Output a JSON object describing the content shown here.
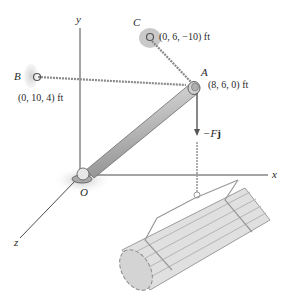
{
  "diagram": {
    "axes": {
      "x_label": "x",
      "y_label": "y",
      "z_label": "z"
    },
    "points": {
      "origin": {
        "label": "O"
      },
      "A": {
        "label": "A",
        "coords": "(8, 6, 0) ft"
      },
      "B": {
        "label": "B",
        "coords": "(0, 10, 4) ft"
      },
      "C": {
        "label": "C",
        "coords": "(0, 6, −10) ft"
      }
    },
    "force": {
      "label_prefix": "−F",
      "label_vector": "j"
    },
    "colors": {
      "axis": "#4a4a4a",
      "boom": "#b9b9b9",
      "cable": "#8a8a8a",
      "support": "#c8c8c8",
      "load": "#d6d6d6",
      "text": "#2a2a2a"
    }
  }
}
